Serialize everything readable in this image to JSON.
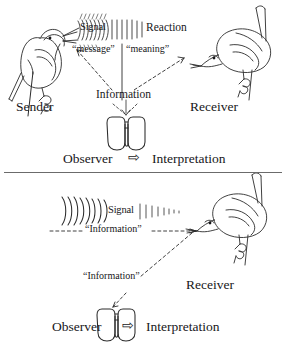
{
  "figure": {
    "style": "hand-drawn ink line illustration, black on white",
    "panels": [
      {
        "id": "top",
        "name": "dyadic-communication-panel",
        "labels": {
          "signal": "Signal",
          "reaction": "Reaction",
          "message": "“message”",
          "meaning": "“meaning”",
          "information": "Information",
          "sender": "Sender",
          "receiver": "Receiver",
          "observer": "Observer",
          "interpretation": "Interpretation",
          "arrow_glyph": "⇨"
        },
        "icons": {
          "sender_bird": "bird-singing-icon",
          "receiver_bird": "bird-listening-icon",
          "observer": "binoculars-icon",
          "sound_waves": "sound-wave-arcs-icon"
        }
      },
      {
        "id": "bottom",
        "name": "observer-information-panel",
        "labels": {
          "signal": "Signal",
          "information_upper": "“Information”",
          "information_lower": "“Information”",
          "receiver": "Receiver",
          "observer": "Observer",
          "interpretation": "Interpretation",
          "arrow_glyph": "⇨"
        },
        "icons": {
          "receiver_bird": "bird-listening-icon",
          "observer": "binoculars-icon",
          "sound_waves": "sound-wave-arcs-icon"
        }
      }
    ],
    "colors": {
      "ink": "#17171a",
      "line": "#3a3a3a",
      "divider": "#6b6b6b",
      "background": "#ffffff"
    }
  }
}
